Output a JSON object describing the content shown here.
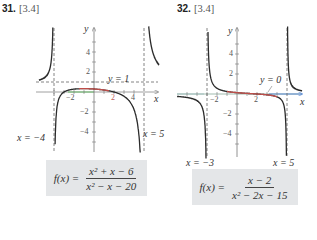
{
  "problems": [
    {
      "number": "31.",
      "section": "[3.4]",
      "formula": {
        "lhs": "f(x) =",
        "numerator": "x² + x − 6",
        "denominator": "x² − x − 20"
      },
      "asymptote_labels": {
        "left": "x = −4",
        "right": "x = 5",
        "horizontal": "y = 1"
      },
      "axis_labels": {
        "x": "x",
        "y": "y"
      },
      "tick_labels": {
        "x": [
          "−2",
          "2",
          "4"
        ],
        "y": [
          "4",
          "2",
          "−2",
          "−4"
        ]
      }
    },
    {
      "number": "32.",
      "section": "[3.4]",
      "formula": {
        "lhs": "f(x) =",
        "numerator": "x − 2",
        "denominator": "x² − 2x − 15"
      },
      "asymptote_labels": {
        "left": "x = −3",
        "right": "x = 5",
        "horizontal": "y = 0"
      },
      "axis_labels": {
        "x": "x",
        "y": "y"
      },
      "tick_labels": {
        "x": [
          "−2",
          "2"
        ],
        "y": [
          "4",
          "2",
          "−2",
          "−4"
        ]
      }
    }
  ],
  "colors": {
    "curve": "#2b2b2b",
    "axis": "#555555",
    "asymptote": "#666666",
    "highlight_red": "#d9534f",
    "highlight_green": "#5cb85c",
    "highlight_blue": "#4a7fd4",
    "formula_box": "#e4e6e8"
  },
  "chart_data": [
    {
      "type": "line",
      "title": "31. [3.4] f(x) = (x^2 + x - 6)/(x^2 - x - 20)",
      "function": "(x^2 + x - 6)/(x^2 - x - 20)",
      "xlabel": "x",
      "ylabel": "y",
      "xlim": [
        -5.5,
        6.5
      ],
      "ylim": [
        -6,
        6
      ],
      "x_ticks": [
        -4,
        -3,
        -2,
        -1,
        1,
        2,
        3,
        4
      ],
      "x_tick_labels": {
        "-2": "−2",
        "2": "2",
        "4": "4"
      },
      "y_ticks": [
        -5,
        -4,
        -3,
        -2,
        -1,
        1,
        2,
        3,
        4,
        5
      ],
      "y_tick_labels": {
        "4": "4",
        "2": "2",
        "-2": "−2",
        "-4": "−4"
      },
      "vertical_asymptotes": [
        -4,
        5
      ],
      "horizontal_asymptote": 1,
      "x_intercepts": [
        -3,
        2
      ],
      "y_intercept": 0.3,
      "highlighted_segment": {
        "x_from": -1.5,
        "x_to": 1.5
      },
      "sample_points": [
        [
          -5.5,
          1.64
        ],
        [
          -5,
          2.0
        ],
        [
          -4.5,
          3.1
        ],
        [
          -3.5,
          -0.75
        ],
        [
          -3,
          0
        ],
        [
          -2,
          0.29
        ],
        [
          0,
          0.3
        ],
        [
          1,
          0.2
        ],
        [
          2,
          0
        ],
        [
          3,
          -0.86
        ],
        [
          4,
          -3.5
        ],
        [
          4.5,
          -8.8
        ],
        [
          5.5,
          6.3
        ],
        [
          6,
          3.6
        ]
      ],
      "grid": false
    },
    {
      "type": "line",
      "title": "32. [3.4] f(x) = (x - 2)/(x^2 - 2x - 15)",
      "function": "(x - 2)/(x^2 - 2x - 15)",
      "xlabel": "x",
      "ylabel": "y",
      "xlim": [
        -6,
        6.5
      ],
      "ylim": [
        -6.5,
        6
      ],
      "x_ticks": [
        -5,
        -4,
        -3,
        -2,
        -1,
        1,
        2,
        3,
        4
      ],
      "x_tick_labels": {
        "-2": "−2",
        "2": "2"
      },
      "y_ticks": [
        -5,
        -4,
        -3,
        -2,
        -1,
        1,
        2,
        3,
        4,
        5
      ],
      "y_tick_labels": {
        "4": "4",
        "2": "2",
        "-2": "−2",
        "-4": "−4"
      },
      "vertical_asymptotes": [
        -3,
        5
      ],
      "horizontal_asymptote": 0,
      "x_intercepts": [
        2
      ],
      "y_intercept": 0.133,
      "highlighted_segment": {
        "x_from": -1,
        "x_to": 4
      },
      "sample_points": [
        [
          -6,
          -0.24
        ],
        [
          -5,
          -0.35
        ],
        [
          -4,
          -0.67
        ],
        [
          -3.5,
          -1.45
        ],
        [
          -2.5,
          1.9
        ],
        [
          -2,
          0.57
        ],
        [
          0,
          0.13
        ],
        [
          2,
          0
        ],
        [
          3,
          -0.08
        ],
        [
          4,
          -0.29
        ],
        [
          4.5,
          -0.67
        ],
        [
          5.5,
          0.41
        ],
        [
          6,
          0.44
        ]
      ],
      "grid": false
    }
  ]
}
